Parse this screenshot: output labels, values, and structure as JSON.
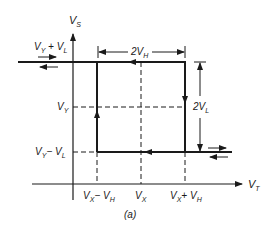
{
  "figure": {
    "caption": "(a)",
    "type": "hysteresis loop"
  },
  "axes": {
    "y_label": "V",
    "y_label_sub": "S",
    "x_label": "V",
    "x_label_sub": "T"
  },
  "y_levels": [
    {
      "main": "V",
      "sub": "Y",
      "op": " + ",
      "main2": "V",
      "sub2": "L"
    },
    {
      "main": "V",
      "sub": "Y"
    },
    {
      "main": "V",
      "sub": "Y",
      "op": "− ",
      "main2": "V",
      "sub2": "L"
    }
  ],
  "x_levels": [
    {
      "main": "V",
      "sub": "X",
      "op": "− ",
      "main2": "V",
      "sub2": "H"
    },
    {
      "main": "V",
      "sub": "X"
    },
    {
      "main": "V",
      "sub": "X",
      "op": "+ ",
      "main2": "V",
      "sub2": "H"
    }
  ],
  "dimensions": {
    "width_label": {
      "coef": "2",
      "main": "V",
      "sub": "H"
    },
    "height_label": {
      "coef": "2",
      "main": "V",
      "sub": "L"
    }
  },
  "colors": {
    "line": "#1a1a1a",
    "background": "#ffffff"
  }
}
